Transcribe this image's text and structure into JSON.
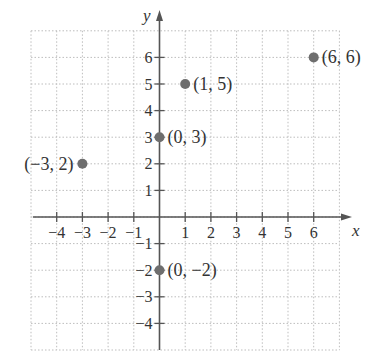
{
  "chart_data": {
    "type": "scatter",
    "title": "",
    "xlabel": "x",
    "ylabel": "y",
    "xlim": [
      -5,
      7
    ],
    "ylim": [
      -5,
      7
    ],
    "grid": true,
    "grid_style": "dotted",
    "x_ticks": [
      -4,
      -3,
      -2,
      -1,
      1,
      2,
      3,
      4,
      5,
      6
    ],
    "y_ticks": [
      6,
      5,
      4,
      3,
      2,
      1,
      -1,
      -2,
      -3,
      -4
    ],
    "x_tick_labels": [
      "−4",
      "−3",
      "−2",
      "−1",
      "1",
      "2",
      "3",
      "4",
      "5",
      "6"
    ],
    "y_tick_labels": [
      "6",
      "5",
      "4",
      "3",
      "2",
      "1",
      "−1",
      "−2",
      "−3",
      "−4"
    ],
    "points": [
      {
        "x": -3,
        "y": 2,
        "label": "(−3, 2)"
      },
      {
        "x": 0,
        "y": 3,
        "label": "(0, 3)"
      },
      {
        "x": 1,
        "y": 5,
        "label": "(1, 5)"
      },
      {
        "x": 6,
        "y": 6,
        "label": "(6, 6)"
      },
      {
        "x": 0,
        "y": -2,
        "label": "(0, −2)"
      }
    ],
    "colors": {
      "axis": "#555555",
      "grid": "#bdbdbd",
      "point": "#6e6e6e",
      "text": "#333333"
    }
  }
}
